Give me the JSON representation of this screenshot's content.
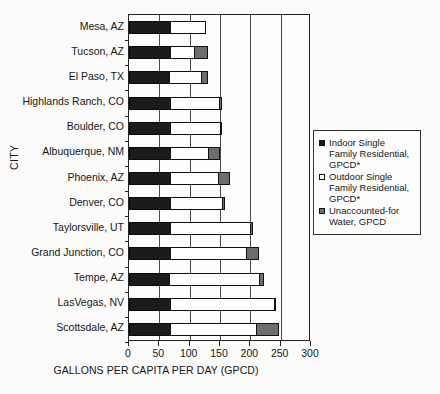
{
  "chart_data": {
    "type": "bar",
    "orientation": "horizontal",
    "stacked": true,
    "title": "",
    "xlabel": "GALLONS PER CAPITA PER DAY (GPCD)",
    "ylabel": "CITY",
    "xlim": [
      0,
      300
    ],
    "xticks": [
      0,
      50,
      100,
      150,
      200,
      250,
      300
    ],
    "xtick_labels": [
      "0",
      "50",
      "100",
      "150",
      "200",
      "250",
      "300"
    ],
    "grid": "vertical",
    "legend_position": "right-outside",
    "categories": [
      "Mesa, AZ",
      "Tucson, AZ",
      "El Paso, TX",
      "Highlands Ranch, CO",
      "Boulder, CO",
      "Albuquerque,  NM",
      "Phoenix, AZ",
      "Denver, CO",
      "Taylorsville, UT",
      "Grand Junction, CO",
      "Tempe, AZ",
      "LasVegas, NV",
      "Scottsdale, AZ"
    ],
    "series": [
      {
        "name": "Indoor Single Family Residential, GPCD*",
        "color": "#1b1b1b",
        "values": [
          70,
          70,
          68,
          70,
          70,
          70,
          70,
          70,
          70,
          70,
          68,
          70,
          70
        ]
      },
      {
        "name": "Outdoor Single Family Residential, GPCD*",
        "color": "#ffffff",
        "values": [
          58,
          40,
          54,
          82,
          84,
          63,
          80,
          87,
          133,
          127,
          150,
          173,
          142
        ]
      },
      {
        "name": "Unaccounted-for Water, GPCD",
        "color": "#6d6d6d",
        "values": [
          0,
          23,
          11,
          5,
          3,
          21,
          20,
          5,
          4,
          20,
          8,
          3,
          38
        ]
      }
    ],
    "totals": [
      128,
      133,
      133,
      157,
      157,
      154,
      170,
      162,
      207,
      217,
      226,
      246,
      250
    ]
  },
  "legend": {
    "items": [
      {
        "swatch": "indoor",
        "label": "Indoor Single Family Residential, GPCD*"
      },
      {
        "swatch": "outdoor",
        "label": "Outdoor Single Family Residential, GPCD*"
      },
      {
        "swatch": "unaccounted",
        "label": "Unaccounted-for Water, GPCD"
      }
    ]
  }
}
